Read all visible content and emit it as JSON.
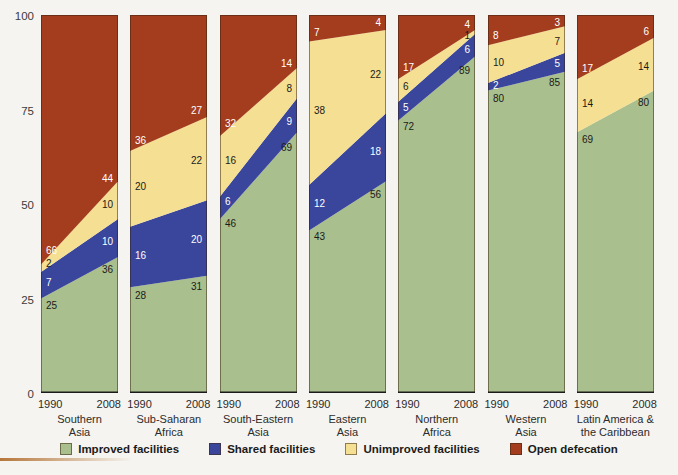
{
  "figure": {
    "background": "#f5f4f0",
    "accent_strip_color": "#b5763a"
  },
  "y_axis": {
    "tick_labels": [
      "0",
      "25",
      "50",
      "75",
      "100"
    ],
    "tick_values": [
      0,
      25,
      50,
      75,
      100
    ]
  },
  "chart_data": {
    "type": "area",
    "stacked": true,
    "units": "percent of population",
    "x_years": [
      "1990",
      "2008"
    ],
    "ylim": [
      0,
      100
    ],
    "grid": false,
    "legend_position": "bottom",
    "series_keys": [
      "improved",
      "shared",
      "unimproved",
      "open"
    ],
    "legend": [
      {
        "key": "improved",
        "label": "Improved facilities",
        "color": "#a9bf8d",
        "label_color": "#1b1b1b"
      },
      {
        "key": "shared",
        "label": "Shared facilities",
        "color": "#3a459c",
        "label_color": "#ffffff"
      },
      {
        "key": "unimproved",
        "label": "Unimproved facilities",
        "color": "#f4df92",
        "label_color": "#1b1b1b"
      },
      {
        "key": "open",
        "label": "Open defecation",
        "color": "#a43d1e",
        "label_color": "#ffffff"
      }
    ],
    "regions": [
      {
        "name_lines": [
          "Southern",
          "Asia"
        ],
        "y1990": {
          "improved": 25,
          "shared": 7,
          "unimproved": 2,
          "open": 66
        },
        "y2008": {
          "improved": 36,
          "shared": 10,
          "unimproved": 10,
          "open": 44
        }
      },
      {
        "name_lines": [
          "Sub-Saharan",
          "Africa"
        ],
        "y1990": {
          "improved": 28,
          "shared": 16,
          "unimproved": 20,
          "open": 36
        },
        "y2008": {
          "improved": 31,
          "shared": 20,
          "unimproved": 22,
          "open": 27
        }
      },
      {
        "name_lines": [
          "South-Eastern",
          "Asia"
        ],
        "y1990": {
          "improved": 46,
          "shared": 6,
          "unimproved": 16,
          "open": 32
        },
        "y2008": {
          "improved": 69,
          "shared": 9,
          "unimproved": 8,
          "open": 14
        }
      },
      {
        "name_lines": [
          "Eastern",
          "Asia"
        ],
        "y1990": {
          "improved": 43,
          "shared": 12,
          "unimproved": 38,
          "open": 7
        },
        "y2008": {
          "improved": 56,
          "shared": 18,
          "unimproved": 22,
          "open": 4
        }
      },
      {
        "name_lines": [
          "Northern",
          "Africa"
        ],
        "y1990": {
          "improved": 72,
          "shared": 5,
          "unimproved": 6,
          "open": 17
        },
        "y2008": {
          "improved": 89,
          "shared": 6,
          "unimproved": 1,
          "open": 4
        }
      },
      {
        "name_lines": [
          "Western",
          "Asia"
        ],
        "y1990": {
          "improved": 80,
          "shared": 2,
          "unimproved": 10,
          "open": 8
        },
        "y2008": {
          "improved": 85,
          "shared": 5,
          "unimproved": 7,
          "open": 3
        }
      },
      {
        "name_lines": [
          "Latin America &",
          "the Caribbean"
        ],
        "y1990": {
          "improved": 69,
          "shared": 0,
          "unimproved": 14,
          "open": 17
        },
        "y2008": {
          "improved": 80,
          "shared": 0,
          "unimproved": 14,
          "open": 6
        }
      }
    ]
  }
}
